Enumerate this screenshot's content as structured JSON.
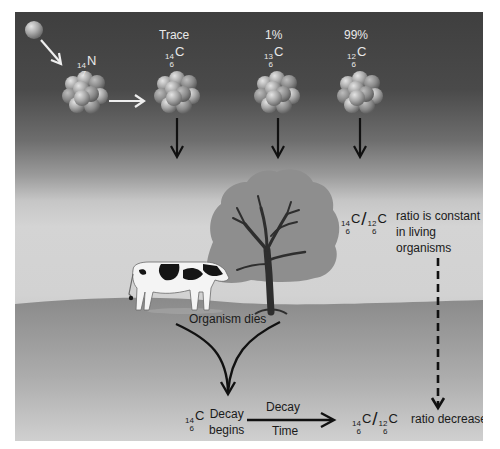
{
  "diagram": {
    "colors": {
      "sky_top": "#3f3f3f",
      "sky_bottom": "#d4d4d4",
      "ground": "#8a8a8a",
      "ground_bottom": "#cdcdcd",
      "tree_canopy": "#8f8f8f",
      "trunk": "#2e2e2e",
      "arrow": "#111111",
      "nucleus": "#a9a9a9",
      "light_label": "#e9e9e9",
      "dark_label": "#1a1a1a"
    },
    "nuclei": [
      {
        "id": "nitrogen-14",
        "mass": "14",
        "atomic": "7",
        "symbol": "N",
        "caption": ""
      },
      {
        "id": "carbon-14",
        "mass": "14",
        "atomic": "6",
        "symbol": "C",
        "caption": "Trace"
      },
      {
        "id": "carbon-13",
        "mass": "13",
        "atomic": "6",
        "symbol": "C",
        "caption": "1%"
      },
      {
        "id": "carbon-12",
        "mass": "12",
        "atomic": "6",
        "symbol": "C",
        "caption": "99%"
      }
    ],
    "ratio_living": {
      "num_mass": "14",
      "num_atomic": "6",
      "num_symbol": "C",
      "den_mass": "12",
      "den_atomic": "6",
      "den_symbol": "C",
      "slash": "/",
      "text_line1": "ratio is constant",
      "text_line2": "in living",
      "text_line3": "organisms"
    },
    "organism_dies": "Organism dies",
    "decay_begins": {
      "mass": "14",
      "atomic": "6",
      "symbol": "C",
      "line1": "Decay",
      "line2": "begins"
    },
    "decay_time": {
      "top": "Decay",
      "bottom": "Time"
    },
    "ratio_decreased": {
      "num_mass": "14",
      "num_atomic": "6",
      "num_symbol": "C",
      "den_mass": "12",
      "den_atomic": "6",
      "den_symbol": "C",
      "slash": "/",
      "text": "ratio decreased"
    }
  }
}
